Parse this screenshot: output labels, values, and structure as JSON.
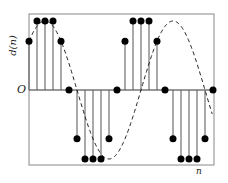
{
  "chart_data": {
    "type": "stem",
    "title": "",
    "xlabel": "n",
    "ylabel": "d(n)",
    "origin_label": "O",
    "x": [
      0,
      1,
      2,
      3,
      4,
      5,
      6,
      7,
      8,
      9,
      10,
      11,
      12,
      13,
      14,
      15,
      16,
      17,
      18,
      19,
      20,
      21,
      22,
      23
    ],
    "values": [
      0.707,
      1.0,
      1.0,
      1.0,
      0.707,
      0.0,
      -0.707,
      -1.0,
      -1.0,
      -1.0,
      -0.707,
      0.0,
      0.707,
      1.0,
      1.0,
      1.0,
      0.707,
      0.0,
      -0.707,
      -1.0,
      -1.0,
      -1.0,
      -0.707,
      0.0
    ],
    "pixel_y": [
      55,
      30,
      21,
      30,
      55,
      90,
      125,
      150,
      158,
      150,
      125,
      90,
      55,
      30,
      21,
      30,
      55,
      90,
      125,
      150,
      158,
      150,
      125,
      90
    ],
    "envelope": "dashed sinusoid",
    "grid": false,
    "frame": true
  },
  "labels": {
    "ylabel": "d(n)",
    "xlabel": "n",
    "origin": "O"
  }
}
